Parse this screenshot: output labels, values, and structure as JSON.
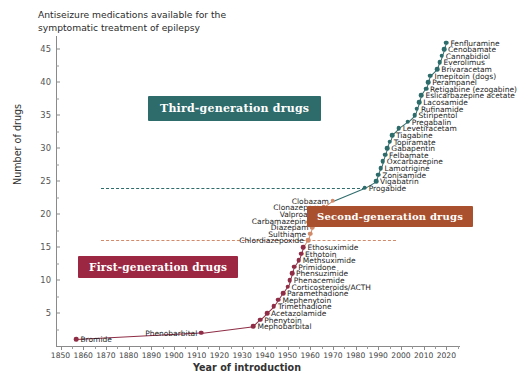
{
  "title": "Antiseizure medications available for the\nsymptomatic treatment of epilepsy",
  "colors": {
    "first_generation": "#9b2743",
    "second_generation": "#a9512f",
    "third_generation": "#2e6b6b",
    "marker_first": "#8e2d45",
    "marker_second": "#d18a6a",
    "marker_third": "#2e6b6b",
    "axis": "#8a8a8a",
    "background": "#ffffff"
  },
  "banners": [
    {
      "id": "third-generation",
      "label": "Third-generation drugs"
    },
    {
      "id": "second-generation",
      "label": "Second-generation drugs"
    },
    {
      "id": "first-generation",
      "label": "First-generation drugs"
    }
  ],
  "chart_data": {
    "type": "line",
    "title": "Antiseizure medications available for the symptomatic treatment of epilepsy",
    "xlabel": "Year of introduction",
    "ylabel": "Number of drugs",
    "xlim": [
      1848,
      2026
    ],
    "ylim": [
      0,
      47
    ],
    "xticks": [
      1850,
      1860,
      1870,
      1880,
      1890,
      1900,
      1910,
      1920,
      1930,
      1940,
      1950,
      1960,
      1970,
      1980,
      1990,
      2000,
      2010,
      2020
    ],
    "yticks": [
      5,
      10,
      15,
      20,
      25,
      30,
      35,
      40,
      45
    ],
    "grid": false,
    "legend": "none",
    "guides": [
      {
        "y": 24,
        "color": "#2e6b6b",
        "x_from": 1868,
        "x_to": 1984
      },
      {
        "y": 16,
        "color": "#d18a6a",
        "x_from": 1868,
        "x_to": 1998
      }
    ],
    "points": [
      {
        "x": 1857,
        "y": 1,
        "label": "Bromide",
        "gen": "first",
        "side": "right"
      },
      {
        "x": 1912,
        "y": 2,
        "label": "Phenobarbital",
        "gen": "first",
        "side": "left"
      },
      {
        "x": 1935,
        "y": 3,
        "label": "Mephobarbital",
        "gen": "first",
        "side": "right"
      },
      {
        "x": 1938,
        "y": 4,
        "label": "Phenytoin",
        "gen": "first",
        "side": "right"
      },
      {
        "x": 1941,
        "y": 5,
        "label": "Acetazolamide",
        "gen": "first",
        "side": "right"
      },
      {
        "x": 1944,
        "y": 6,
        "label": "Trimethadione",
        "gen": "first",
        "side": "right"
      },
      {
        "x": 1946,
        "y": 7,
        "label": "Mephenytoin",
        "gen": "first",
        "side": "right"
      },
      {
        "x": 1948,
        "y": 8,
        "label": "Paramethadione",
        "gen": "first",
        "side": "right"
      },
      {
        "x": 1950,
        "y": 9,
        "label": "Corticosteroids/ACTH",
        "gen": "first",
        "side": "right"
      },
      {
        "x": 1951,
        "y": 10,
        "label": "Phenacemide",
        "gen": "first",
        "side": "right"
      },
      {
        "x": 1952,
        "y": 11,
        "label": "Phensuzimide",
        "gen": "first",
        "side": "right"
      },
      {
        "x": 1953,
        "y": 12,
        "label": "Primidone",
        "gen": "first",
        "side": "right"
      },
      {
        "x": 1955,
        "y": 13,
        "label": "Methsuximide",
        "gen": "first",
        "side": "right"
      },
      {
        "x": 1956,
        "y": 14,
        "label": "Ethotoin",
        "gen": "first",
        "side": "right"
      },
      {
        "x": 1957,
        "y": 15,
        "label": "Ethosuximide",
        "gen": "first",
        "side": "right"
      },
      {
        "x": 1959,
        "y": 16,
        "label": "Chlordiazepoxide",
        "gen": "second",
        "side": "left"
      },
      {
        "x": 1960,
        "y": 17,
        "label": "Sulthiame",
        "gen": "second",
        "side": "left"
      },
      {
        "x": 1961,
        "y": 18,
        "label": "Diazepam",
        "gen": "second",
        "side": "left"
      },
      {
        "x": 1962,
        "y": 19,
        "label": "Carbamazepine",
        "gen": "second",
        "side": "left"
      },
      {
        "x": 1964,
        "y": 20,
        "label": "Valproate",
        "gen": "second",
        "side": "left"
      },
      {
        "x": 1966,
        "y": 21,
        "label": "Clonazepam",
        "gen": "second",
        "side": "left"
      },
      {
        "x": 1970,
        "y": 22,
        "label": "Clobazam",
        "gen": "second",
        "side": "left"
      },
      {
        "x": 1984,
        "y": 24,
        "label": "Progabide",
        "gen": "third",
        "side": "right"
      },
      {
        "x": 1989,
        "y": 25,
        "label": "Vigabatrin",
        "gen": "third",
        "side": "right"
      },
      {
        "x": 1990,
        "y": 26,
        "label": "Zonisamide",
        "gen": "third",
        "side": "right"
      },
      {
        "x": 1991,
        "y": 27,
        "label": "Lamotrigine",
        "gen": "third",
        "side": "right"
      },
      {
        "x": 1992,
        "y": 28,
        "label": "Oxcarbazepine",
        "gen": "third",
        "side": "right"
      },
      {
        "x": 1993,
        "y": 29,
        "label": "Felbamate",
        "gen": "third",
        "side": "right"
      },
      {
        "x": 1994,
        "y": 30,
        "label": "Gabapentin",
        "gen": "third",
        "side": "right"
      },
      {
        "x": 1995,
        "y": 31,
        "label": "Topiramate",
        "gen": "third",
        "side": "right"
      },
      {
        "x": 1996,
        "y": 32,
        "label": "Tiagabine",
        "gen": "third",
        "side": "right"
      },
      {
        "x": 1999,
        "y": 33,
        "label": "Levetiracetam",
        "gen": "third",
        "side": "right"
      },
      {
        "x": 2003,
        "y": 34,
        "label": "Pregabalin",
        "gen": "third",
        "side": "right"
      },
      {
        "x": 2006,
        "y": 35,
        "label": "Stiripentol",
        "gen": "third",
        "side": "right"
      },
      {
        "x": 2007,
        "y": 36,
        "label": "Rufinamide",
        "gen": "third",
        "side": "right"
      },
      {
        "x": 2008,
        "y": 37,
        "label": "Lacosamide",
        "gen": "third",
        "side": "right"
      },
      {
        "x": 2009,
        "y": 38,
        "label": "Eslicarbazepine acetate",
        "gen": "third",
        "side": "right"
      },
      {
        "x": 2011,
        "y": 39,
        "label": "Retigabine (ezogabine)",
        "gen": "third",
        "side": "right"
      },
      {
        "x": 2012,
        "y": 40,
        "label": "Perampanel",
        "gen": "third",
        "side": "right"
      },
      {
        "x": 2013,
        "y": 41,
        "label": "Imepitoin (dogs)",
        "gen": "third",
        "side": "right"
      },
      {
        "x": 2016,
        "y": 42,
        "label": "Brivaracetam",
        "gen": "third",
        "side": "right"
      },
      {
        "x": 2017,
        "y": 43,
        "label": "Everolimus",
        "gen": "third",
        "side": "right"
      },
      {
        "x": 2018,
        "y": 44,
        "label": "Cannabidiol",
        "gen": "third",
        "side": "right"
      },
      {
        "x": 2019,
        "y": 45,
        "label": "Cenobamate",
        "gen": "third",
        "side": "right"
      },
      {
        "x": 2020,
        "y": 46,
        "label": "Fenfluramine",
        "gen": "third",
        "side": "right"
      }
    ]
  }
}
